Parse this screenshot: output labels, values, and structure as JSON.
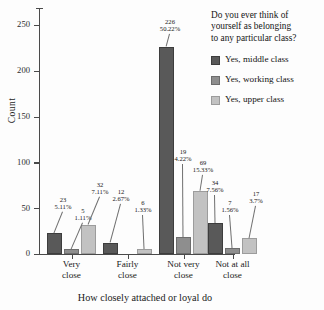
{
  "chart_data": {
    "type": "bar",
    "title": "",
    "categories": [
      "Very close",
      "Fairly close",
      "Not very close",
      "Not at all close"
    ],
    "category_lines": [
      [
        "Very",
        "close"
      ],
      [
        "Fairly",
        "close"
      ],
      [
        "Not very",
        "close"
      ],
      [
        "Not at all",
        "close"
      ]
    ],
    "series": [
      {
        "name": "Yes, middle class",
        "color": "#595959",
        "values": [
          23,
          12,
          226,
          34
        ],
        "percent_labels": [
          "5.11%",
          "2.67%",
          "50.22%",
          "7.56%"
        ]
      },
      {
        "name": "Yes, working class",
        "color": "#8e8e8e",
        "values": [
          5,
          0,
          19,
          7
        ],
        "percent_labels": [
          "1.11%",
          "",
          "4.22%",
          "1.56%"
        ]
      },
      {
        "name": "Yes, upper class",
        "color": "#c2c2c2",
        "values": [
          32,
          6,
          69,
          17
        ],
        "percent_labels": [
          "7.11%",
          "1.33%",
          "15.33%",
          "3.7%"
        ]
      }
    ],
    "xlabel": "How closely attached or loyal do",
    "ylabel": "Count",
    "ylim": [
      0,
      250
    ],
    "yticks": [
      0,
      50,
      100,
      150,
      200,
      250
    ],
    "grid": false,
    "legend_position": "right"
  },
  "legend": {
    "title": "Do you ever think of yourself as belonging to any particular class?",
    "title_lines": [
      "Do you ever think of",
      "yourself as belonging",
      "to any particular class?"
    ],
    "entries": [
      {
        "label": "Yes, middle class",
        "color": "#595959"
      },
      {
        "label": "Yes, working class",
        "color": "#8e8e8e"
      },
      {
        "label": "Yes, upper class",
        "color": "#c2c2c2"
      }
    ]
  },
  "axes": {
    "y_title": "Count",
    "x_title": "How closely attached or loyal do",
    "y_tick_labels": [
      "0",
      "50",
      "100",
      "150",
      "200",
      "250"
    ]
  }
}
